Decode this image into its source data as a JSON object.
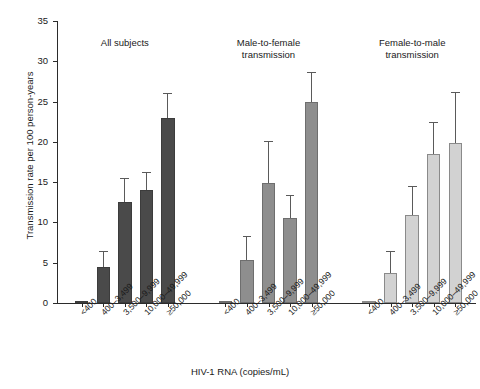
{
  "chart_data": {
    "type": "bar",
    "title": "",
    "xlabel": "HIV-1 RNA (copies/mL)",
    "ylabel": "Transmission rate per 100 person-years",
    "ylim": [
      0,
      35
    ],
    "yticks": [
      0,
      5,
      10,
      15,
      20,
      25,
      30,
      35
    ],
    "ytick_labels": [
      "0",
      "5",
      "10",
      "15",
      "20",
      "25",
      "30",
      "35"
    ],
    "grid": false,
    "legend": "none",
    "categories": [
      "<400",
      "400–3,499",
      "3,500–9,999",
      "10,000–49,999",
      "≥50,000"
    ],
    "panels": [
      {
        "name": "All subjects",
        "title": "All subjects",
        "color": "#4a4a4a",
        "values": [
          0.1,
          4.5,
          12.5,
          14.0,
          23.0
        ],
        "err_upper": [
          0.1,
          6.5,
          15.5,
          16.3,
          26.1
        ]
      },
      {
        "name": "Male-to-female transmission",
        "title": "Male-to-female\ntransmission",
        "color": "#8e8e8e",
        "values": [
          0.1,
          5.3,
          14.9,
          10.6,
          24.9
        ],
        "err_upper": [
          0.1,
          8.3,
          20.1,
          13.4,
          28.7
        ]
      },
      {
        "name": "Female-to-male transmission",
        "title": "Female-to-male\ntransmission",
        "color": "#d2d2d2",
        "values": [
          0.1,
          3.7,
          10.9,
          18.5,
          19.8
        ],
        "err_upper": [
          0.1,
          6.4,
          14.5,
          22.5,
          26.2
        ]
      }
    ]
  },
  "axes": {
    "y_label": "Transmission rate per 100 person-years",
    "x_label": "HIV-1 RNA (copies/mL)"
  }
}
